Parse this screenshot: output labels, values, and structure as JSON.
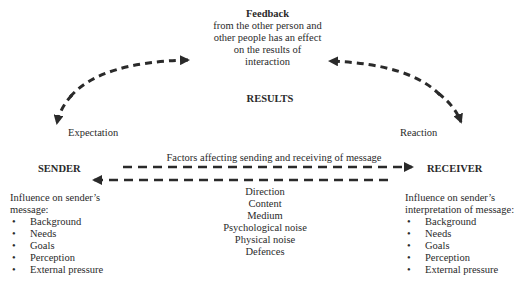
{
  "feedback": {
    "title": "Feedback",
    "lines": [
      "from the other person and",
      "other people has an effect",
      "on the results of",
      "interaction"
    ]
  },
  "results": {
    "label": "RESULTS"
  },
  "expectation": {
    "label": "Expectation"
  },
  "reaction": {
    "label": "Reaction"
  },
  "sender": {
    "title": "SENDER",
    "influence_lines": [
      "Influence on sender’s",
      "message:"
    ],
    "items": [
      "Background",
      "Needs",
      "Goals",
      "Perception",
      "External pressure"
    ]
  },
  "receiver": {
    "title": "RECEIVER",
    "influence_lines": [
      "Influence on sender’s",
      "interpretation of message:"
    ],
    "items": [
      "Background",
      "Needs",
      "Goals",
      "Perception",
      "External pressure"
    ]
  },
  "factors": {
    "title": "Factors affecting sending and receiving of message",
    "items": [
      "Direction",
      "Content",
      "Medium",
      "Psychological noise",
      "Physical noise",
      "Defences"
    ]
  },
  "bullet_glyph": "•",
  "colors": {
    "arrow": "#2a2a2a",
    "text": "#2a2a2a",
    "background": "#ffffff"
  }
}
